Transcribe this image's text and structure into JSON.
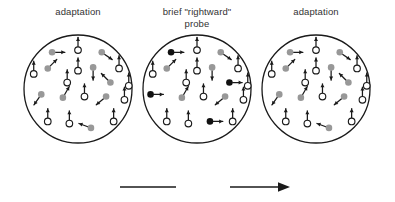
{
  "figure": {
    "time_axis": {
      "label": "time",
      "direction": "rightward"
    },
    "colors": {
      "outline": "#1a1a1a",
      "open_dot_fill": "#ffffff",
      "gray_dot_fill": "#989898",
      "black_dot_fill": "#111111",
      "arrow": "#1a1a1a",
      "text": "#333333",
      "background": "#ffffff"
    },
    "legend_semantics": {
      "open_dot": "stationary / upward-drifting test dot",
      "gray_dot": "adapting dot",
      "black_dot": "probe dot moving rightward"
    }
  },
  "panels": [
    {
      "id": "adaptation-left",
      "label": "adaptation",
      "dot_count": 20,
      "dots": [
        {
          "x": 0.26,
          "y": 0.16,
          "kind": "gray",
          "angle": 0
        },
        {
          "x": 0.5,
          "y": 0.14,
          "kind": "open",
          "angle": -90
        },
        {
          "x": 0.72,
          "y": 0.16,
          "kind": "gray",
          "angle": 35
        },
        {
          "x": 0.22,
          "y": 0.31,
          "kind": "gray",
          "angle": -45
        },
        {
          "x": 0.5,
          "y": 0.33,
          "kind": "open",
          "angle": -90
        },
        {
          "x": 0.64,
          "y": 0.3,
          "kind": "gray",
          "angle": 90
        },
        {
          "x": 0.88,
          "y": 0.31,
          "kind": "open",
          "angle": -90
        },
        {
          "x": 0.09,
          "y": 0.36,
          "kind": "open",
          "angle": -90
        },
        {
          "x": 0.8,
          "y": 0.44,
          "kind": "gray",
          "angle": -135
        },
        {
          "x": 0.97,
          "y": 0.47,
          "kind": "open",
          "angle": -90
        },
        {
          "x": 0.16,
          "y": 0.55,
          "kind": "gray",
          "angle": 125
        },
        {
          "x": 0.36,
          "y": 0.58,
          "kind": "gray",
          "angle": -60
        },
        {
          "x": 0.56,
          "y": 0.57,
          "kind": "open",
          "angle": -90
        },
        {
          "x": 0.76,
          "y": 0.57,
          "kind": "gray",
          "angle": 140
        },
        {
          "x": 0.93,
          "y": 0.6,
          "kind": "open",
          "angle": -90
        },
        {
          "x": 0.22,
          "y": 0.8,
          "kind": "open",
          "angle": -90
        },
        {
          "x": 0.42,
          "y": 0.82,
          "kind": "open",
          "angle": -90
        },
        {
          "x": 0.62,
          "y": 0.86,
          "kind": "gray",
          "angle": 200
        },
        {
          "x": 0.83,
          "y": 0.8,
          "kind": "open",
          "angle": -90
        },
        {
          "x": 0.4,
          "y": 0.44,
          "kind": "open",
          "angle": -90
        }
      ]
    },
    {
      "id": "probe-middle",
      "label": "brief \"rightward\"\nprobe",
      "dot_count": 20,
      "dots": [
        {
          "x": 0.26,
          "y": 0.16,
          "kind": "black",
          "angle": 0
        },
        {
          "x": 0.5,
          "y": 0.14,
          "kind": "open",
          "angle": -90
        },
        {
          "x": 0.72,
          "y": 0.16,
          "kind": "gray",
          "angle": 35
        },
        {
          "x": 0.22,
          "y": 0.31,
          "kind": "gray",
          "angle": -45
        },
        {
          "x": 0.5,
          "y": 0.33,
          "kind": "open",
          "angle": -90
        },
        {
          "x": 0.64,
          "y": 0.3,
          "kind": "gray",
          "angle": 90
        },
        {
          "x": 0.88,
          "y": 0.31,
          "kind": "open",
          "angle": -90
        },
        {
          "x": 0.09,
          "y": 0.36,
          "kind": "open",
          "angle": -90
        },
        {
          "x": 0.8,
          "y": 0.44,
          "kind": "black",
          "angle": 0
        },
        {
          "x": 0.97,
          "y": 0.47,
          "kind": "open",
          "angle": -90
        },
        {
          "x": 0.07,
          "y": 0.55,
          "kind": "black",
          "angle": 0
        },
        {
          "x": 0.36,
          "y": 0.58,
          "kind": "gray",
          "angle": -60
        },
        {
          "x": 0.56,
          "y": 0.57,
          "kind": "open",
          "angle": -90
        },
        {
          "x": 0.76,
          "y": 0.57,
          "kind": "gray",
          "angle": 140
        },
        {
          "x": 0.93,
          "y": 0.6,
          "kind": "open",
          "angle": -90
        },
        {
          "x": 0.22,
          "y": 0.8,
          "kind": "open",
          "angle": -90
        },
        {
          "x": 0.42,
          "y": 0.82,
          "kind": "open",
          "angle": -90
        },
        {
          "x": 0.62,
          "y": 0.8,
          "kind": "black",
          "angle": 0
        },
        {
          "x": 0.83,
          "y": 0.8,
          "kind": "open",
          "angle": -90
        },
        {
          "x": 0.4,
          "y": 0.44,
          "kind": "open",
          "angle": -90
        }
      ]
    },
    {
      "id": "adaptation-right",
      "label": "adaptation",
      "dot_count": 20,
      "dots": [
        {
          "x": 0.26,
          "y": 0.16,
          "kind": "gray",
          "angle": 0
        },
        {
          "x": 0.5,
          "y": 0.14,
          "kind": "open",
          "angle": -90
        },
        {
          "x": 0.72,
          "y": 0.16,
          "kind": "gray",
          "angle": 35
        },
        {
          "x": 0.22,
          "y": 0.31,
          "kind": "gray",
          "angle": -45
        },
        {
          "x": 0.5,
          "y": 0.33,
          "kind": "open",
          "angle": -90
        },
        {
          "x": 0.64,
          "y": 0.3,
          "kind": "gray",
          "angle": 90
        },
        {
          "x": 0.88,
          "y": 0.31,
          "kind": "open",
          "angle": -90
        },
        {
          "x": 0.09,
          "y": 0.36,
          "kind": "open",
          "angle": -90
        },
        {
          "x": 0.8,
          "y": 0.44,
          "kind": "gray",
          "angle": -135
        },
        {
          "x": 0.97,
          "y": 0.47,
          "kind": "open",
          "angle": -90
        },
        {
          "x": 0.16,
          "y": 0.55,
          "kind": "gray",
          "angle": 125
        },
        {
          "x": 0.36,
          "y": 0.58,
          "kind": "gray",
          "angle": -60
        },
        {
          "x": 0.56,
          "y": 0.57,
          "kind": "open",
          "angle": -90
        },
        {
          "x": 0.76,
          "y": 0.57,
          "kind": "gray",
          "angle": 140
        },
        {
          "x": 0.93,
          "y": 0.6,
          "kind": "open",
          "angle": -90
        },
        {
          "x": 0.22,
          "y": 0.8,
          "kind": "open",
          "angle": -90
        },
        {
          "x": 0.42,
          "y": 0.82,
          "kind": "open",
          "angle": -90
        },
        {
          "x": 0.62,
          "y": 0.86,
          "kind": "gray",
          "angle": 200
        },
        {
          "x": 0.83,
          "y": 0.8,
          "kind": "open",
          "angle": -90
        },
        {
          "x": 0.4,
          "y": 0.44,
          "kind": "open",
          "angle": -90
        }
      ]
    }
  ]
}
